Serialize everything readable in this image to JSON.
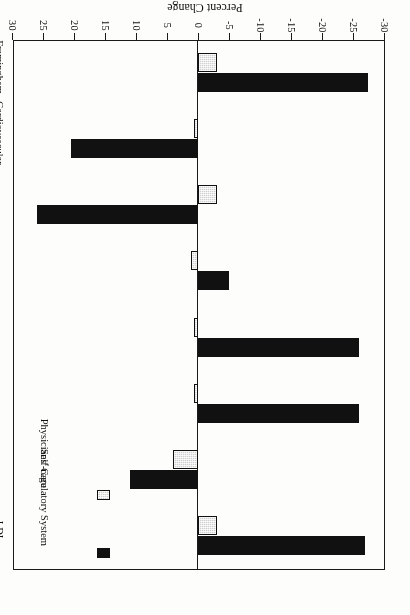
{
  "chart_data": {
    "type": "bar",
    "orientation": "horizontal",
    "title": "",
    "xlabel": "Percent Change",
    "ylabel": "",
    "xlim": [
      -30,
      30
    ],
    "xticks": [
      30,
      25,
      20,
      15,
      10,
      5,
      0,
      -5,
      -10,
      -15,
      -20,
      -25,
      -30
    ],
    "xtick_labels": [
      "30",
      "25",
      "20",
      "15",
      "10",
      "5",
      "0",
      "-5",
      "-10",
      "-15",
      "-20",
      "-25",
      "-30"
    ],
    "grid": false,
    "legend_position": "upper-left",
    "rotated_180": true,
    "categories": [
      "LDL Cholesterol",
      "HDL Cholesterol",
      "Triglycerides",
      "Dietary Fat",
      "Weight",
      "Exercise",
      "Cardiovascular Capacity",
      "Framingham Risk Index"
    ],
    "category_lines": [
      [
        "LDL",
        "Cholesterol"
      ],
      [
        "HDL",
        ""
      ],
      [
        "Triglycerides",
        ""
      ],
      [
        "Dietary Fat",
        ""
      ],
      [
        "Weight",
        ""
      ],
      [
        "Exercise",
        ""
      ],
      [
        "Cardiovascular",
        "Capacity"
      ],
      [
        "Framingham",
        "Risk Index"
      ]
    ],
    "series": [
      {
        "name": "Self-regulatory System",
        "color": "#111111",
        "values": [
          -27.0,
          11.0,
          -26.0,
          -26.0,
          -5.0,
          26.0,
          20.5,
          -27.5
        ]
      },
      {
        "name": "Physicians' Care",
        "color": "#cfcfcf",
        "values": [
          -3.0,
          4.0,
          0.7,
          0.7,
          1.2,
          -3.0,
          0.7,
          -3.0
        ]
      }
    ]
  },
  "axis": {
    "title": "Percent Change"
  },
  "legend": {
    "items": [
      {
        "label": "Self-regulatory System",
        "swatch": "black-square-icon"
      },
      {
        "label": "Physicians' Care",
        "swatch": "gray-square-icon"
      }
    ]
  }
}
